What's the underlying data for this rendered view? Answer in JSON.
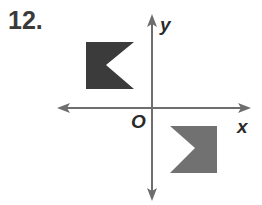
{
  "problem": {
    "number": "12."
  },
  "axes": {
    "x_label": "x",
    "y_label": "y",
    "origin_label": "O",
    "color": "#6e6e6e"
  },
  "figures": [
    {
      "name": "preimage",
      "quadrant": "II",
      "color": "#3b3b3b",
      "points": "86,42 134,42 106,65 134,89 86,89"
    },
    {
      "name": "image",
      "quadrant": "IV",
      "color": "#717171",
      "points": "170,126 217,126 217,173 170,173 195,148"
    }
  ]
}
